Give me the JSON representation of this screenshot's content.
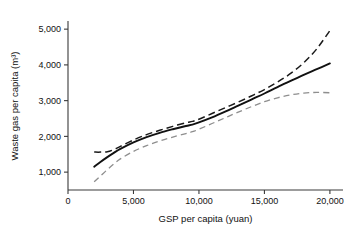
{
  "chart_data": {
    "type": "line",
    "title": "",
    "xlabel": "GSP per capita (yuan)",
    "ylabel": "Waste gas per capita (m³)",
    "xlim": [
      0,
      21000
    ],
    "ylim": [
      500,
      5200
    ],
    "xticks": [
      0,
      5000,
      10000,
      15000,
      20000
    ],
    "xtick_labels": [
      "0",
      "5,000",
      "10,000",
      "15,000",
      "20,000"
    ],
    "yticks": [
      1000,
      2000,
      3000,
      4000,
      5000
    ],
    "ytick_labels": [
      "1,000",
      "2,000",
      "3,000",
      "4,000",
      "5,000"
    ],
    "grid": false,
    "legend": "none",
    "series": [
      {
        "name": "upper confidence bound",
        "style": "dashed",
        "color": "#1a1a1a",
        "x": [
          2000,
          2500,
          3000,
          3500,
          4000,
          5000,
          6000,
          7000,
          8000,
          9000,
          9500,
          10000,
          11000,
          12000,
          13000,
          14000,
          15000,
          16000,
          17000,
          18000,
          19000,
          20000
        ],
        "y": [
          1560,
          1560,
          1570,
          1630,
          1720,
          1900,
          2050,
          2170,
          2280,
          2380,
          2420,
          2480,
          2640,
          2800,
          2960,
          3130,
          3310,
          3520,
          3760,
          4060,
          4450,
          4960
        ]
      },
      {
        "name": "fitted curve",
        "style": "solid",
        "color": "#111111",
        "x": [
          2000,
          2500,
          3000,
          3500,
          4000,
          5000,
          6000,
          7000,
          8000,
          9000,
          9500,
          10000,
          11000,
          12000,
          13000,
          14000,
          15000,
          16000,
          17000,
          18000,
          19000,
          20000
        ],
        "y": [
          1150,
          1290,
          1420,
          1540,
          1650,
          1830,
          1980,
          2100,
          2200,
          2290,
          2330,
          2390,
          2530,
          2690,
          2860,
          3030,
          3200,
          3380,
          3550,
          3720,
          3880,
          4040
        ]
      },
      {
        "name": "lower confidence bound",
        "style": "dashed",
        "color": "#8e8e8e",
        "x": [
          2000,
          2500,
          3000,
          3500,
          4000,
          5000,
          6000,
          7000,
          8000,
          9000,
          9500,
          10000,
          11000,
          12000,
          13000,
          14000,
          15000,
          16000,
          17000,
          18000,
          19000,
          20000
        ],
        "y": [
          730,
          900,
          1070,
          1230,
          1370,
          1580,
          1740,
          1870,
          1980,
          2080,
          2130,
          2200,
          2360,
          2520,
          2680,
          2830,
          2970,
          3080,
          3160,
          3210,
          3230,
          3220
        ]
      }
    ]
  }
}
